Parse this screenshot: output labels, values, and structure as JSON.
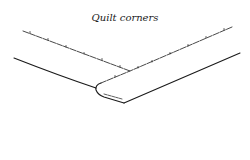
{
  "figure": {
    "title": "Quilt corners",
    "stroke_color": "#1a1a1a",
    "background": "#ffffff"
  }
}
